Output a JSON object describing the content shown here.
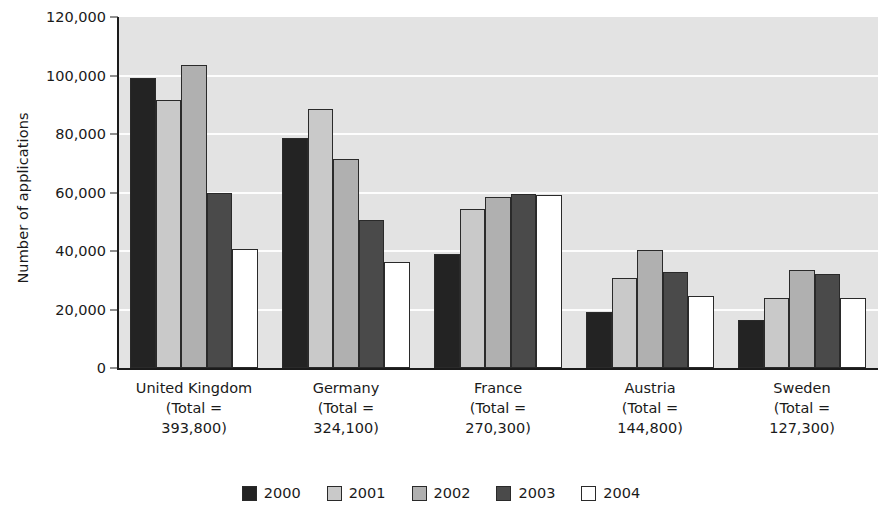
{
  "chart_data": {
    "type": "bar",
    "title": "",
    "xlabel": "",
    "ylabel": "Number of applications",
    "ylim": [
      0,
      120000
    ],
    "yticks": [
      0,
      20000,
      40000,
      60000,
      80000,
      100000,
      120000
    ],
    "ytick_labels": [
      "0",
      "20,000",
      "40,000",
      "60,000",
      "80,000",
      "100,000",
      "120,000"
    ],
    "grid": true,
    "legend_position": "bottom",
    "categories": [
      "United Kingdom",
      "Germany",
      "France",
      "Austria",
      "Sweden"
    ],
    "category_totals": [
      "393,800",
      "324,100",
      "270,300",
      "144,800",
      "127,300"
    ],
    "category_total_prefix": "(Total =",
    "category_total_suffix": ")",
    "series": [
      {
        "name": "2000",
        "color": "#232323",
        "values": [
          99000,
          78500,
          39000,
          19000,
          16500
        ]
      },
      {
        "name": "2001",
        "color": "#c9c9c9",
        "values": [
          91500,
          88700,
          54500,
          30800,
          24000
        ]
      },
      {
        "name": "2002",
        "color": "#b0b0b0",
        "values": [
          103500,
          71500,
          58500,
          40200,
          33500
        ]
      },
      {
        "name": "2003",
        "color": "#4a4a4a",
        "values": [
          59800,
          50500,
          59500,
          32700,
          32000
        ]
      },
      {
        "name": "2004",
        "color": "#ffffff",
        "values": [
          40800,
          36100,
          59000,
          24700,
          23800
        ]
      }
    ]
  }
}
